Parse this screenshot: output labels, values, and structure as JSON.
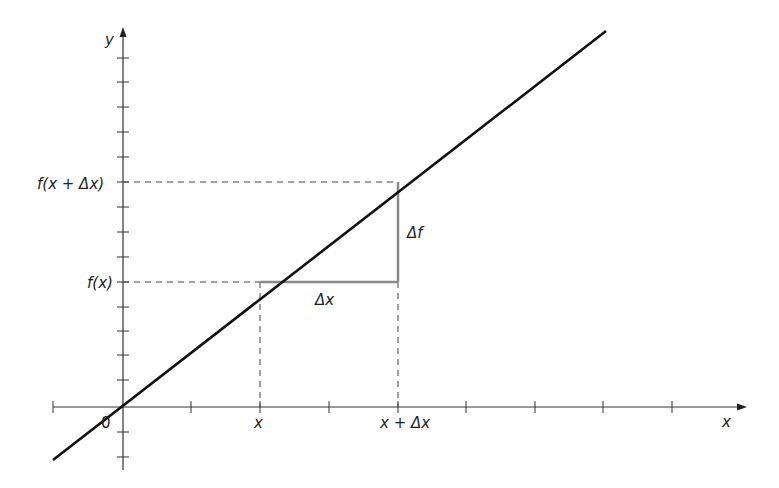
{
  "diagram": {
    "axes": {
      "x_label": "x",
      "y_label": "y",
      "origin_label": "0"
    },
    "x_markers": {
      "x": "x",
      "x_plus_dx": "x + Δx"
    },
    "y_markers": {
      "fx": "f(x)",
      "fx_plus_dx": "f(x +  Δx)"
    },
    "triangle": {
      "horizontal_label": "Δx",
      "vertical_label": "Δf"
    },
    "colors": {
      "axis": "#333333",
      "line": "#111111",
      "triangle": "#8a8a8a",
      "dashed": "#444444"
    }
  }
}
